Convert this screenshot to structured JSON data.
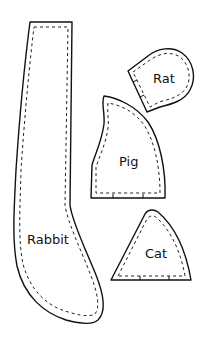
{
  "diagram": {
    "type": "sewing-pattern",
    "colors": {
      "background": "#ffffff",
      "line": "#111111"
    },
    "pieces": [
      {
        "id": "rabbit",
        "label": "Rabbit"
      },
      {
        "id": "rat",
        "label": "Rat"
      },
      {
        "id": "pig",
        "label": "Pig"
      },
      {
        "id": "cat",
        "label": "Cat"
      }
    ]
  }
}
